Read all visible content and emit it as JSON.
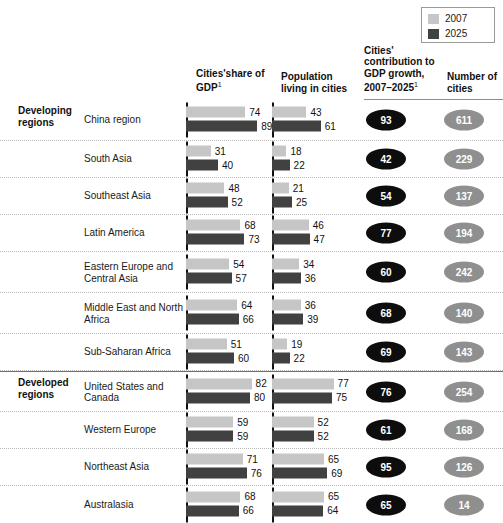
{
  "legend": {
    "items": [
      {
        "label": "2007",
        "color": "#c6c6c6"
      },
      {
        "label": "2025",
        "color": "#414141"
      }
    ]
  },
  "headers": {
    "cities_share": "Cities'share of GDP",
    "cities_share_footnote": "1",
    "population": "Population living in cities",
    "contribution": "Cities' contribution to GDP growth, 2007–2025",
    "contribution_footnote": "1",
    "number_of_cities": "Number of cities"
  },
  "groups": [
    {
      "label": "Developing regions"
    },
    {
      "label": "Developed regions"
    }
  ],
  "chart_data": {
    "type": "bar",
    "title": "",
    "xlabel": "",
    "ylabel": "",
    "categories": [
      "China region",
      "South Asia",
      "Southeast Asia",
      "Latin America",
      "Eastern Europe and Central Asia",
      "Middle East and North Africa",
      "Sub-Saharan Africa",
      "United States and Canada",
      "Western Europe",
      "Northeast Asia",
      "Australasia"
    ],
    "series": [
      {
        "name": "Cities' share of GDP, 2007",
        "values": [
          74,
          31,
          48,
          68,
          54,
          64,
          51,
          82,
          59,
          71,
          68
        ]
      },
      {
        "name": "Cities' share of GDP, 2025",
        "values": [
          89,
          40,
          52,
          73,
          57,
          66,
          60,
          80,
          59,
          76,
          66
        ]
      },
      {
        "name": "Population living in cities, 2007",
        "values": [
          43,
          18,
          21,
          46,
          34,
          36,
          19,
          77,
          52,
          65,
          65
        ]
      },
      {
        "name": "Population living in cities, 2025",
        "values": [
          61,
          22,
          25,
          47,
          36,
          39,
          22,
          75,
          52,
          69,
          64
        ]
      }
    ],
    "contribution_to_gdp_growth": [
      93,
      42,
      54,
      77,
      60,
      68,
      69,
      76,
      61,
      95,
      65
    ],
    "number_of_cities": [
      611,
      229,
      137,
      194,
      242,
      140,
      143,
      254,
      168,
      126,
      14
    ],
    "xlim": [
      0,
      100
    ],
    "grid": false,
    "legend_position": "top-right"
  },
  "rows": [
    {
      "group": "Developing regions",
      "region": "China region",
      "gdp_2007": 74,
      "gdp_2025": 89,
      "pop_2007": 43,
      "pop_2025": 61,
      "contribution": 93,
      "cities": 611
    },
    {
      "group": "",
      "region": "South Asia",
      "gdp_2007": 31,
      "gdp_2025": 40,
      "pop_2007": 18,
      "pop_2025": 22,
      "contribution": 42,
      "cities": 229
    },
    {
      "group": "",
      "region": "Southeast Asia",
      "gdp_2007": 48,
      "gdp_2025": 52,
      "pop_2007": 21,
      "pop_2025": 25,
      "contribution": 54,
      "cities": 137
    },
    {
      "group": "",
      "region": "Latin America",
      "gdp_2007": 68,
      "gdp_2025": 73,
      "pop_2007": 46,
      "pop_2025": 47,
      "contribution": 77,
      "cities": 194
    },
    {
      "group": "",
      "region": "Eastern Europe and Central Asia",
      "gdp_2007": 54,
      "gdp_2025": 57,
      "pop_2007": 34,
      "pop_2025": 36,
      "contribution": 60,
      "cities": 242
    },
    {
      "group": "",
      "region": "Middle East and North Africa",
      "gdp_2007": 64,
      "gdp_2025": 66,
      "pop_2007": 36,
      "pop_2025": 39,
      "contribution": 68,
      "cities": 140
    },
    {
      "group": "",
      "region": "Sub-Saharan Africa",
      "gdp_2007": 51,
      "gdp_2025": 60,
      "pop_2007": 19,
      "pop_2025": 22,
      "contribution": 69,
      "cities": 143
    },
    {
      "group": "Developed regions",
      "region": "United States and Canada",
      "gdp_2007": 82,
      "gdp_2025": 80,
      "pop_2007": 77,
      "pop_2025": 75,
      "contribution": 76,
      "cities": 254
    },
    {
      "group": "",
      "region": "Western Europe",
      "gdp_2007": 59,
      "gdp_2025": 59,
      "pop_2007": 52,
      "pop_2025": 52,
      "contribution": 61,
      "cities": 168
    },
    {
      "group": "",
      "region": "Northeast Asia",
      "gdp_2007": 71,
      "gdp_2025": 76,
      "pop_2007": 65,
      "pop_2025": 69,
      "contribution": 95,
      "cities": 126
    },
    {
      "group": "",
      "region": "Australasia",
      "gdp_2007": 68,
      "gdp_2025": 66,
      "pop_2007": 65,
      "pop_2025": 64,
      "contribution": 65,
      "cities": 14
    }
  ]
}
